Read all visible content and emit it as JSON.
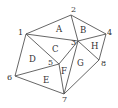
{
  "diagram": {
    "type": "triangulation",
    "stroke_color": "#555555",
    "text_color": "#333333",
    "vertices": [
      {
        "id": "1",
        "x": 26,
        "y": 34,
        "lx": 18,
        "ly": 35
      },
      {
        "id": "2",
        "x": 71,
        "y": 15,
        "lx": 71,
        "ly": 12
      },
      {
        "id": "3",
        "x": 78,
        "y": 41,
        "lx": 71,
        "ly": 45
      },
      {
        "id": "4",
        "x": 106,
        "y": 34,
        "lx": 107,
        "ly": 35
      },
      {
        "id": "5",
        "x": 59,
        "y": 64,
        "lx": 48,
        "ly": 65
      },
      {
        "id": "6",
        "x": 15,
        "y": 76,
        "lx": 7,
        "ly": 80
      },
      {
        "id": "7",
        "x": 64,
        "y": 94,
        "lx": 62,
        "ly": 102
      },
      {
        "id": "8",
        "x": 99,
        "y": 60,
        "lx": 101,
        "ly": 66
      }
    ],
    "edges": [
      [
        "1",
        "2"
      ],
      [
        "2",
        "4"
      ],
      [
        "4",
        "8"
      ],
      [
        "8",
        "7"
      ],
      [
        "7",
        "6"
      ],
      [
        "6",
        "1"
      ],
      [
        "1",
        "3"
      ],
      [
        "2",
        "3"
      ],
      [
        "3",
        "4"
      ],
      [
        "3",
        "8"
      ],
      [
        "3",
        "7"
      ],
      [
        "3",
        "5"
      ],
      [
        "1",
        "5"
      ],
      [
        "5",
        "7"
      ],
      [
        "6",
        "5"
      ]
    ],
    "faces": [
      {
        "label": "A",
        "vertices": [
          "1",
          "2",
          "3"
        ],
        "x": 56,
        "y": 32
      },
      {
        "label": "B",
        "vertices": [
          "2",
          "3",
          "4"
        ],
        "x": 80,
        "y": 33
      },
      {
        "label": "C",
        "vertices": [
          "1",
          "3",
          "5"
        ],
        "x": 52,
        "y": 52
      },
      {
        "label": "D",
        "vertices": [
          "1",
          "5",
          "6"
        ],
        "x": 29,
        "y": 62
      },
      {
        "label": "E",
        "vertices": [
          "5",
          "6",
          "7"
        ],
        "x": 43,
        "y": 83
      },
      {
        "label": "F",
        "vertices": [
          "3",
          "5",
          "7"
        ],
        "x": 61,
        "y": 74
      },
      {
        "label": "G",
        "vertices": [
          "3",
          "8",
          "7"
        ],
        "x": 77,
        "y": 66
      },
      {
        "label": "H",
        "vertices": [
          "3",
          "4",
          "8"
        ],
        "x": 91,
        "y": 49
      }
    ]
  }
}
